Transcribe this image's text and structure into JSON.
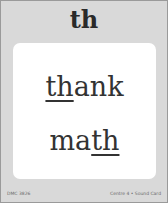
{
  "card": {
    "header": "th",
    "words": [
      {
        "prefix": "",
        "highlight": "th",
        "suffix": "ank"
      },
      {
        "prefix": "ma",
        "highlight": "th",
        "suffix": ""
      }
    ],
    "footer": {
      "left": "DMC 3826",
      "right": "Centre 4 • Sound Card"
    }
  },
  "colors": {
    "card_bg": "#d9d9d9",
    "panel_bg": "#ffffff",
    "text": "#333333"
  }
}
